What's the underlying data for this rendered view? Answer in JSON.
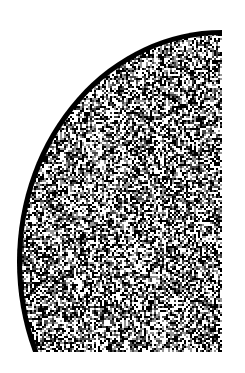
{
  "figure": {
    "colors": {
      "background": "#ffffff",
      "border": "#000000",
      "noise_dark": "#000000",
      "noise_light": "#ffffff"
    },
    "shape": {
      "center_x": 222,
      "center_y": 262,
      "radius_x": 205,
      "radius_y": 232,
      "bottom_y": 352,
      "border_width": 5
    }
  }
}
